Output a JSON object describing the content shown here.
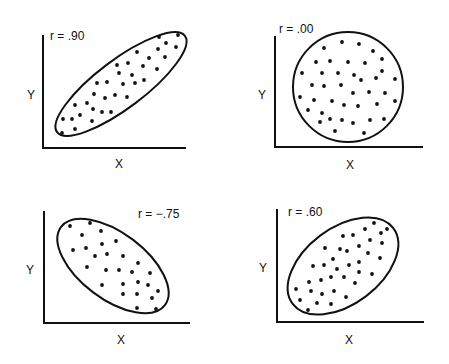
{
  "chart_data": [
    {
      "type": "scatter",
      "title": "r = .90",
      "xlabel": "X",
      "ylabel": "Y",
      "correlation": 0.9,
      "boundary": {
        "shape": "ellipse",
        "cx": 121,
        "cy": 84,
        "rx": 80,
        "ry": 24,
        "rotate": -37
      },
      "axes": {
        "x0": 43,
        "y0": 148,
        "x1": 186,
        "ytop": 35
      },
      "label_pos": {
        "r": [
          50,
          40
        ],
        "y": [
          27,
          99
        ],
        "x": [
          115,
          168
        ]
      },
      "points": [
        [
          159,
          37
        ],
        [
          178,
          35
        ],
        [
          166,
          43
        ],
        [
          176,
          47
        ],
        [
          137,
          52
        ],
        [
          158,
          49
        ],
        [
          165,
          57
        ],
        [
          149,
          58
        ],
        [
          128,
          63
        ],
        [
          117,
          65
        ],
        [
          143,
          66
        ],
        [
          157,
          69
        ],
        [
          132,
          75
        ],
        [
          119,
          73
        ],
        [
          97,
          83
        ],
        [
          107,
          82
        ],
        [
          123,
          84
        ],
        [
          135,
          83
        ],
        [
          144,
          80
        ],
        [
          94,
          94
        ],
        [
          105,
          98
        ],
        [
          115,
          95
        ],
        [
          127,
          97
        ],
        [
          87,
          103
        ],
        [
          75,
          105
        ],
        [
          93,
          109
        ],
        [
          102,
          112
        ],
        [
          111,
          112
        ],
        [
          80,
          115
        ],
        [
          63,
          119
        ],
        [
          72,
          119
        ],
        [
          92,
          121
        ],
        [
          62,
          133
        ],
        [
          75,
          129
        ]
      ]
    },
    {
      "type": "scatter",
      "title": "r = .00",
      "xlabel": "X",
      "ylabel": "Y",
      "correlation": 0.0,
      "boundary": {
        "shape": "circle",
        "cx": 348,
        "cy": 87,
        "r": 55
      },
      "axes": {
        "x0": 275,
        "y0": 147,
        "x1": 423,
        "ytop": 36
      },
      "label_pos": {
        "r": [
          279,
          33
        ],
        "y": [
          258,
          99
        ],
        "x": [
          346,
          169
        ]
      },
      "points": [
        [
          342,
          42
        ],
        [
          359,
          44
        ],
        [
          324,
          48
        ],
        [
          373,
          51
        ],
        [
          382,
          59
        ],
        [
          316,
          62
        ],
        [
          330,
          61
        ],
        [
          348,
          62
        ],
        [
          365,
          63
        ],
        [
          382,
          71
        ],
        [
          302,
          73
        ],
        [
          322,
          73
        ],
        [
          338,
          73
        ],
        [
          354,
          75
        ],
        [
          361,
          80
        ],
        [
          376,
          78
        ],
        [
          395,
          79
        ],
        [
          312,
          85
        ],
        [
          324,
          86
        ],
        [
          341,
          85
        ],
        [
          353,
          93
        ],
        [
          369,
          92
        ],
        [
          385,
          93
        ],
        [
          300,
          97
        ],
        [
          314,
          100
        ],
        [
          332,
          101
        ],
        [
          344,
          105
        ],
        [
          358,
          106
        ],
        [
          377,
          104
        ],
        [
          395,
          101
        ],
        [
          308,
          110
        ],
        [
          322,
          113
        ],
        [
          330,
          119
        ],
        [
          342,
          120
        ],
        [
          320,
          122
        ],
        [
          353,
          123
        ],
        [
          370,
          120
        ],
        [
          384,
          119
        ],
        [
          335,
          131
        ],
        [
          364,
          133
        ]
      ]
    },
    {
      "type": "scatter",
      "title": "r = −.75",
      "xlabel": "X",
      "ylabel": "Y",
      "correlation": -0.75,
      "boundary": {
        "shape": "ellipse",
        "cx": 113,
        "cy": 266,
        "rx": 65,
        "ry": 33,
        "rotate": 37
      },
      "axes": {
        "x0": 44,
        "y0": 323,
        "x1": 190,
        "ytop": 211
      },
      "label_pos": {
        "r": [
          138,
          218
        ],
        "y": [
          26,
          274
        ],
        "x": [
          117,
          344
        ]
      },
      "points": [
        [
          70,
          226
        ],
        [
          90,
          223
        ],
        [
          82,
          235
        ],
        [
          101,
          231
        ],
        [
          116,
          241
        ],
        [
          102,
          244
        ],
        [
          73,
          250
        ],
        [
          86,
          248
        ],
        [
          95,
          256
        ],
        [
          107,
          254
        ],
        [
          123,
          256
        ],
        [
          138,
          263
        ],
        [
          87,
          267
        ],
        [
          106,
          270
        ],
        [
          119,
          270
        ],
        [
          132,
          272
        ],
        [
          150,
          273
        ],
        [
          102,
          285
        ],
        [
          123,
          284
        ],
        [
          138,
          282
        ],
        [
          148,
          285
        ],
        [
          158,
          291
        ],
        [
          123,
          294
        ],
        [
          137,
          294
        ],
        [
          152,
          298
        ],
        [
          137,
          308
        ],
        [
          156,
          309
        ]
      ]
    },
    {
      "type": "scatter",
      "title": "r = .60",
      "xlabel": "X",
      "ylabel": "Y",
      "correlation": 0.6,
      "boundary": {
        "shape": "ellipse",
        "cx": 343,
        "cy": 266,
        "rx": 63,
        "ry": 38,
        "rotate": -37
      },
      "axes": {
        "x0": 277,
        "y0": 322,
        "x1": 424,
        "ytop": 209
      },
      "label_pos": {
        "r": [
          288,
          216
        ],
        "y": [
          259,
          272
        ],
        "x": [
          345,
          344
        ]
      },
      "points": [
        [
          374,
          223
        ],
        [
          365,
          229
        ],
        [
          387,
          229
        ],
        [
          381,
          233
        ],
        [
          343,
          236
        ],
        [
          353,
          235
        ],
        [
          370,
          240
        ],
        [
          382,
          243
        ],
        [
          359,
          246
        ],
        [
          325,
          248
        ],
        [
          340,
          249
        ],
        [
          347,
          251
        ],
        [
          368,
          253
        ],
        [
          380,
          258
        ],
        [
          333,
          259
        ],
        [
          359,
          262
        ],
        [
          349,
          265
        ],
        [
          313,
          266
        ],
        [
          324,
          265
        ],
        [
          337,
          269
        ],
        [
          359,
          272
        ],
        [
          372,
          274
        ],
        [
          331,
          277
        ],
        [
          344,
          277
        ],
        [
          321,
          280
        ],
        [
          309,
          282
        ],
        [
          355,
          283
        ],
        [
          296,
          289
        ],
        [
          311,
          291
        ],
        [
          322,
          294
        ],
        [
          334,
          291
        ],
        [
          346,
          297
        ],
        [
          300,
          300
        ],
        [
          317,
          303
        ],
        [
          331,
          304
        ],
        [
          308,
          310
        ]
      ]
    }
  ]
}
